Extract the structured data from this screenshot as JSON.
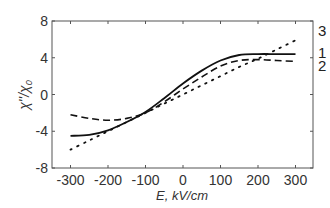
{
  "chart_data": {
    "type": "line",
    "title": "",
    "xlabel": "E, kV/cm",
    "ylabel": "χ'' / χ₀",
    "xlim": [
      -350,
      350
    ],
    "ylim": [
      -8,
      8
    ],
    "xticks": [
      -300,
      -200,
      -100,
      0,
      100,
      200,
      300
    ],
    "yticks": [
      -8,
      -4,
      0,
      4,
      8
    ],
    "grid": false,
    "legend": "inline curve numbers at right edge",
    "x": [
      -300,
      -250,
      -200,
      -150,
      -100,
      -50,
      0,
      50,
      100,
      150,
      200,
      250,
      300
    ],
    "series": [
      {
        "name": "1",
        "style": "solid",
        "values": [
          -4.5,
          -4.4,
          -3.9,
          -3.0,
          -1.9,
          -0.4,
          1.2,
          2.6,
          3.7,
          4.3,
          4.4,
          4.4,
          4.4
        ]
      },
      {
        "name": "2",
        "style": "dashed",
        "values": [
          -2.2,
          -2.6,
          -2.8,
          -2.6,
          -2.0,
          -0.8,
          0.6,
          1.9,
          3.1,
          3.7,
          3.8,
          3.7,
          3.6
        ]
      },
      {
        "name": "3",
        "style": "dotted",
        "values": [
          -6.0,
          -5.0,
          -4.0,
          -3.0,
          -2.0,
          -1.0,
          0.0,
          1.0,
          2.0,
          3.0,
          3.9,
          4.9,
          5.9
        ]
      }
    ]
  },
  "labels": {
    "xlabel": "E, kV/cm",
    "ylabel_main": "χ''",
    "ylabel_sub": "/χ",
    "ylabel_subscript": "0",
    "curve_1": "1",
    "curve_2": "2",
    "curve_3": "3"
  }
}
